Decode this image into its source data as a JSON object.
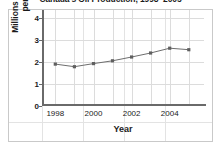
{
  "chart_data": {
    "type": "line",
    "title": "Canada's Oil Production, 1998–2005",
    "xlabel": "Year",
    "ylabel_line1": "Millions of Barrels",
    "ylabel_line2": "per Day",
    "ylabel": "Millions of Barrels per Day",
    "x": [
      1998,
      1999,
      2000,
      2001,
      2002,
      2003,
      2004,
      2005
    ],
    "values": [
      1.9,
      1.78,
      1.92,
      2.05,
      2.22,
      2.4,
      2.62,
      2.55
    ],
    "xlim": [
      1997.3,
      2005.8
    ],
    "ylim": [
      0,
      4.35
    ],
    "ytick_labels": [
      "0",
      "1",
      "2",
      "3",
      "4"
    ],
    "ytick_values": [
      0,
      1,
      2,
      3,
      4
    ],
    "xtick_labels": [
      "1998",
      "2000",
      "2002",
      "2004"
    ],
    "xtick_values": [
      1998,
      2000,
      2002,
      2004
    ],
    "grid": true,
    "legend": "none",
    "series_color": "#6e6e6e",
    "marker_color": "#5f5f5f",
    "grid_color": "#dcdcdc",
    "axis_color": "#6a6a6a"
  }
}
